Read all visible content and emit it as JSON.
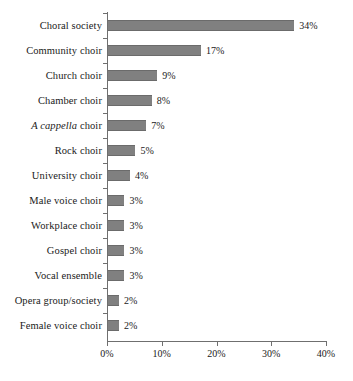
{
  "chart_data": {
    "type": "bar",
    "orientation": "horizontal",
    "title": "",
    "xlabel": "",
    "ylabel": "",
    "xlim": [
      0,
      40
    ],
    "grid": false,
    "legend": null,
    "bar_color": "#808080",
    "axis_color": "#6f6f6f",
    "background": "#ffffff",
    "x_ticks": [
      0,
      10,
      20,
      30,
      40
    ],
    "x_tick_labels": [
      "0%",
      "10%",
      "20%",
      "30%",
      "40%"
    ],
    "categories": [
      "Choral society",
      "Community choir",
      "Church choir",
      "Chamber choir",
      "A cappella choir",
      "Rock choir",
      "University choir",
      "Male voice choir",
      "Workplace choir",
      "Gospel choir",
      "Vocal ensemble",
      "Opera group/society",
      "Female voice choir"
    ],
    "values": [
      34,
      17,
      9,
      8,
      7,
      5,
      4,
      3,
      3,
      3,
      3,
      2,
      2
    ],
    "data_labels": [
      "34%",
      "17%",
      "9%",
      "8%",
      "7%",
      "5%",
      "4%",
      "3%",
      "3%",
      "3%",
      "3%",
      "2%",
      "2%"
    ],
    "category_label_styles": [
      "normal",
      "normal",
      "normal",
      "normal",
      "italic-partial",
      "normal",
      "normal",
      "normal",
      "normal",
      "normal",
      "normal",
      "normal",
      "normal"
    ],
    "italic_segments": {
      "A cappella choir": {
        "italic": "A cappella",
        "roman": " choir"
      }
    }
  },
  "caption": {
    "text": "partially cropped caption line"
  }
}
